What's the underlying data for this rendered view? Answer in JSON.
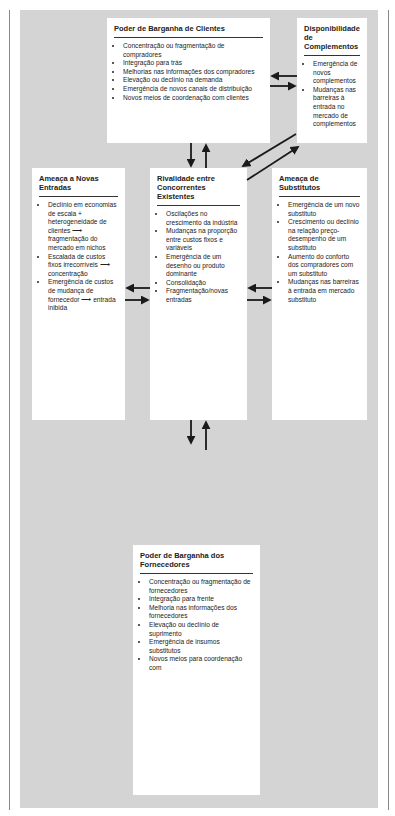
{
  "boxes": {
    "clientes": {
      "title": "Poder de Barganha de Clientes",
      "items": [
        "Concentração ou fragmentação de compradores",
        "Integração para trás",
        "Melhorias nas informações dos compradores",
        "Elevação ou declínio na demanda",
        "Emergência de novos canais de distribuição",
        "Novos meios de coordenação com clientes"
      ]
    },
    "complementos": {
      "title": "Disponibilidade de Complementos",
      "items": [
        "Emergência de novos complementos",
        "Mudanças nas barreiras à entrada no mercado de complementos"
      ]
    },
    "novas_entradas": {
      "title": "Ameaça a Novas Entradas",
      "items": [
        "Declínio em economias de escala + heterogeneidade de clientes ⟶ fragmentação do mercado em nichos",
        "Escalada de custos fixos irrecorríveis ⟶ concentração",
        "Emergência de custos de mudança de fornecedor ⟶ entrada inibida"
      ]
    },
    "rivalidade": {
      "title": "Rivalidade entre Concorrentes Existentes",
      "items": [
        "Oscilações no crescimento da indústria",
        "Mudanças na proporção entre custos fixos e variáveis",
        "Emergência de um desenho ou produto dominante",
        "Consolidação",
        "Fragmentação/novas entradas"
      ]
    },
    "substitutos": {
      "title": "Ameaça de Substitutos",
      "items": [
        "Emergência de um novo substituto",
        "Crescimento ou declínio na relação preço-desempenho de um substituto",
        "Aumento do conforto dos compradores com um substituto",
        "Mudanças nas barreiras à entrada em mercado substituto"
      ]
    },
    "fornecedores": {
      "title": "Poder de Barganha dos Fornecedores",
      "items": [
        "Concentração ou fragmentação de fornecedores",
        "Integração para frente",
        "Melhoria nas informações dos fornecedores",
        "Elevação ou declínio de suprimento",
        "Emergência de insumos substitutos",
        "Novos meios para coordenação com"
      ]
    }
  },
  "colors": {
    "background": "#d4d4d4",
    "box": "#ffffff",
    "arrow": "#1a1a1a"
  }
}
